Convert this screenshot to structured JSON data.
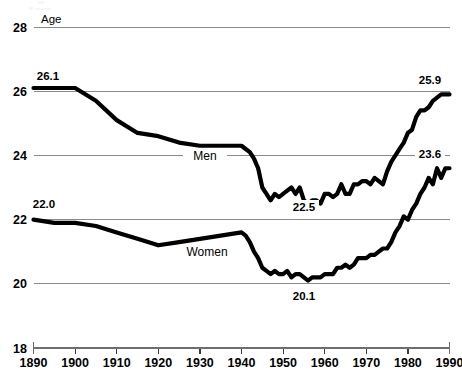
{
  "chart_data": {
    "type": "line",
    "title": "",
    "ylabel": "Age",
    "xlabel": "",
    "ylim": [
      18,
      28
    ],
    "xlim": [
      1890,
      1990
    ],
    "grid": true,
    "legend": "inline-series-labels",
    "y_ticks": [
      "28",
      "26",
      "24",
      "22",
      "20",
      "18"
    ],
    "y_tick_values": [
      28,
      26,
      24,
      22,
      20,
      18
    ],
    "x_ticks": [
      "1890",
      "1900",
      "1910",
      "1920",
      "1930",
      "1940",
      "1950",
      "1960",
      "1970",
      "1980",
      "1990"
    ],
    "x_tick_values": [
      1890,
      1900,
      1910,
      1920,
      1930,
      1940,
      1950,
      1960,
      1970,
      1980,
      1990
    ],
    "annotations": [
      {
        "text": "26.1",
        "series": "Men",
        "x": 1890,
        "y": 26.1
      },
      {
        "text": "25.9",
        "series": "Men",
        "x": 1990,
        "y": 25.9
      },
      {
        "text": "22.5",
        "series": "Men",
        "x": 1956,
        "y": 22.5
      },
      {
        "text": "22.0",
        "series": "Women",
        "x": 1890,
        "y": 22.0
      },
      {
        "text": "23.6",
        "series": "Women",
        "x": 1990,
        "y": 23.6
      },
      {
        "text": "20.1",
        "series": "Women",
        "x": 1956,
        "y": 20.1
      }
    ],
    "series": [
      {
        "name": "Men",
        "label": "Men",
        "color": "#000000",
        "x": [
          1890,
          1895,
          1900,
          1905,
          1910,
          1915,
          1920,
          1925,
          1930,
          1935,
          1940,
          1941,
          1942,
          1943,
          1944,
          1945,
          1946,
          1947,
          1948,
          1949,
          1950,
          1951,
          1952,
          1953,
          1954,
          1955,
          1956,
          1957,
          1958,
          1959,
          1960,
          1961,
          1962,
          1963,
          1964,
          1965,
          1966,
          1967,
          1968,
          1969,
          1970,
          1971,
          1972,
          1973,
          1974,
          1975,
          1976,
          1977,
          1978,
          1979,
          1980,
          1981,
          1982,
          1983,
          1984,
          1985,
          1986,
          1987,
          1988,
          1989,
          1990
        ],
        "values": [
          26.1,
          26.1,
          26.1,
          25.7,
          25.1,
          24.7,
          24.6,
          24.4,
          24.3,
          24.3,
          24.3,
          24.2,
          24.1,
          23.9,
          23.6,
          23.0,
          22.8,
          22.6,
          22.8,
          22.7,
          22.8,
          22.9,
          23.0,
          22.8,
          23.0,
          22.6,
          22.5,
          22.6,
          22.6,
          22.5,
          22.8,
          22.8,
          22.7,
          22.8,
          23.1,
          22.8,
          22.8,
          23.1,
          23.1,
          23.2,
          23.2,
          23.1,
          23.3,
          23.2,
          23.1,
          23.5,
          23.8,
          24.0,
          24.2,
          24.4,
          24.7,
          24.8,
          25.2,
          25.4,
          25.4,
          25.5,
          25.7,
          25.8,
          25.9,
          25.9,
          25.9
        ]
      },
      {
        "name": "Women",
        "label": "Women",
        "color": "#000000",
        "x": [
          1890,
          1895,
          1900,
          1905,
          1910,
          1915,
          1920,
          1925,
          1930,
          1935,
          1940,
          1941,
          1942,
          1943,
          1944,
          1945,
          1946,
          1947,
          1948,
          1949,
          1950,
          1951,
          1952,
          1953,
          1954,
          1955,
          1956,
          1957,
          1958,
          1959,
          1960,
          1961,
          1962,
          1963,
          1964,
          1965,
          1966,
          1967,
          1968,
          1969,
          1970,
          1971,
          1972,
          1973,
          1974,
          1975,
          1976,
          1977,
          1978,
          1979,
          1980,
          1981,
          1982,
          1983,
          1984,
          1985,
          1986,
          1987,
          1988,
          1989,
          1990
        ],
        "values": [
          22.0,
          21.9,
          21.9,
          21.8,
          21.6,
          21.4,
          21.2,
          21.3,
          21.4,
          21.5,
          21.6,
          21.5,
          21.3,
          21.0,
          20.8,
          20.5,
          20.4,
          20.3,
          20.4,
          20.3,
          20.3,
          20.4,
          20.2,
          20.3,
          20.3,
          20.2,
          20.1,
          20.2,
          20.2,
          20.2,
          20.3,
          20.3,
          20.3,
          20.5,
          20.5,
          20.6,
          20.5,
          20.6,
          20.8,
          20.8,
          20.8,
          20.9,
          20.9,
          21.0,
          21.1,
          21.1,
          21.3,
          21.6,
          21.8,
          22.1,
          22.0,
          22.3,
          22.5,
          22.8,
          23.0,
          23.3,
          23.1,
          23.6,
          23.3,
          23.6,
          23.6
        ]
      }
    ]
  }
}
